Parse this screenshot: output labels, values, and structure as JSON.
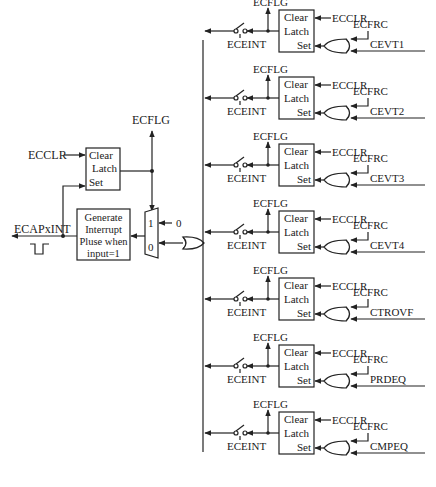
{
  "diagram": {
    "type": "logic-block-diagram",
    "left_section": {
      "latch": {
        "clear": "Clear",
        "latch": "Latch",
        "set": "Set"
      },
      "clear_input": "ECCLR",
      "flag_output": "ECFLG",
      "generator": {
        "line1": "Generate",
        "line2": "Interrupt",
        "line3": "Pluse when",
        "line4": "input=1"
      },
      "output_label": "ECAPxINT",
      "mux": {
        "in1": "1",
        "in0": "0",
        "const_input": "0"
      }
    },
    "rows": [
      {
        "event": "CEVT1",
        "flag": "ECFLG",
        "enable": "ECEINT",
        "clear": "ECCLR",
        "force": "ECFRC",
        "latch": {
          "clear": "Clear",
          "latch": "Latch",
          "set": "Set"
        }
      },
      {
        "event": "CEVT2",
        "flag": "ECFLG",
        "enable": "ECEINT",
        "clear": "ECCLR",
        "force": "ECFRC",
        "latch": {
          "clear": "Clear",
          "latch": "Latch",
          "set": "Set"
        }
      },
      {
        "event": "CEVT3",
        "flag": "ECFLG",
        "enable": "ECEINT",
        "clear": "ECCLR",
        "force": "ECFRC",
        "latch": {
          "clear": "Clear",
          "latch": "Latch",
          "set": "Set"
        }
      },
      {
        "event": "CEVT4",
        "flag": "ECFLG",
        "enable": "ECEINT",
        "clear": "ECCLR",
        "force": "ECFRC",
        "latch": {
          "clear": "Clear",
          "latch": "Latch",
          "set": "Set"
        }
      },
      {
        "event": "CTROVF",
        "flag": "ECFLG",
        "enable": "ECEINT",
        "clear": "ECCLR",
        "force": "ECFRC",
        "latch": {
          "clear": "Clear",
          "latch": "Latch",
          "set": "Set"
        }
      },
      {
        "event": "PRDEQ",
        "flag": "ECFLG",
        "enable": "ECEINT",
        "clear": "ECCLR",
        "force": "ECFRC",
        "latch": {
          "clear": "Clear",
          "latch": "Latch",
          "set": "Set"
        }
      },
      {
        "event": "CMPEQ",
        "flag": "ECFLG",
        "enable": "ECEINT",
        "clear": "ECCLR",
        "force": "ECFRC",
        "latch": {
          "clear": "Clear",
          "latch": "Latch",
          "set": "Set"
        }
      }
    ]
  }
}
